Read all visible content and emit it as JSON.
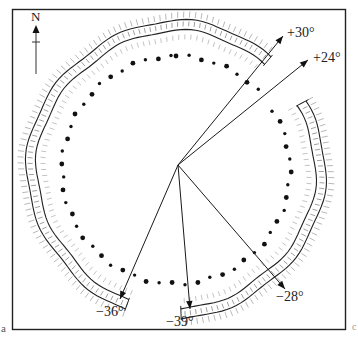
{
  "figure": {
    "panel_letter": "a",
    "corner_mark": "c",
    "north_label": "N",
    "colors": {
      "ink": "#1a1a1a",
      "hatch": "#8a8a8a",
      "frame": "#222222",
      "background": "#ffffff"
    },
    "center": {
      "x": 178,
      "y": 165
    },
    "arrows": [
      {
        "label": "+30°",
        "to": {
          "x": 283,
          "y": 36
        },
        "label_pos": {
          "x": 287,
          "y": 26
        }
      },
      {
        "label": "+24°",
        "to": {
          "x": 308,
          "y": 60
        },
        "label_pos": {
          "x": 313,
          "y": 51
        }
      },
      {
        "label": "−36°",
        "to": {
          "x": 120,
          "y": 299
        },
        "label_pos": {
          "x": 96,
          "y": 305
        }
      },
      {
        "label": "−39°",
        "to": {
          "x": 190,
          "y": 309
        },
        "label_pos": {
          "x": 166,
          "y": 315
        }
      },
      {
        "label": "−28°",
        "to": {
          "x": 285,
          "y": 289
        },
        "label_pos": {
          "x": 276,
          "y": 290
        }
      }
    ]
  }
}
